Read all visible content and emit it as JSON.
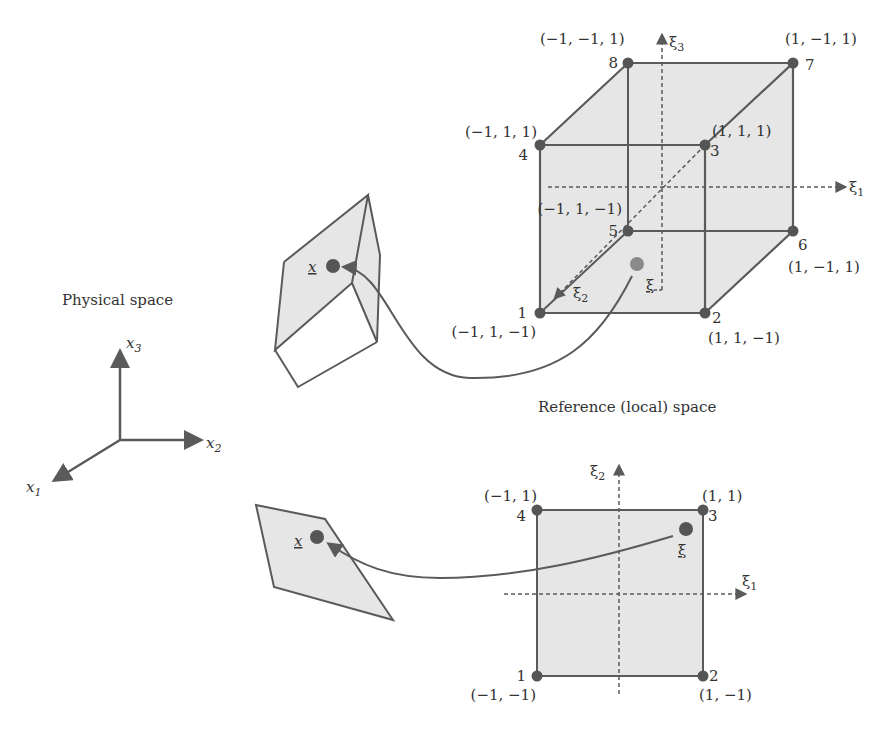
{
  "colors": {
    "edge": "#5a5a5a",
    "fill": "#e6e6e6",
    "node": "#555555",
    "point_ref_3d": "#8a8a8a",
    "text": "#333333",
    "background": "#ffffff"
  },
  "physical_space": {
    "title": "Physical space",
    "axes": {
      "x1": "x",
      "x1_sub": "1",
      "x2": "x",
      "x2_sub": "2",
      "x3": "x",
      "x3_sub": "3"
    },
    "hex_point_label": "x",
    "quad_point_label": "x"
  },
  "reference_space": {
    "title": "Reference (local) space",
    "hex": {
      "axes": {
        "xi1": "ξ",
        "xi1_sub": "1",
        "xi2": "ξ",
        "xi2_sub": "2",
        "xi3": "ξ",
        "xi3_sub": "3"
      },
      "point_label": "ξ",
      "nodes": [
        {
          "id": "1",
          "coords": "(−1, 1, −1)"
        },
        {
          "id": "2",
          "coords": "(1, 1, −1)"
        },
        {
          "id": "3",
          "coords": "(1, 1, 1)"
        },
        {
          "id": "4",
          "coords": "(−1, 1, 1)"
        },
        {
          "id": "5",
          "coords": "(−1, 1, −1)"
        },
        {
          "id": "6",
          "coords": "(1, −1, 1)"
        },
        {
          "id": "7",
          "coords": "(1, −1, 1)"
        },
        {
          "id": "8",
          "coords": "(−1, −1, 1)"
        }
      ]
    },
    "quad": {
      "axes": {
        "xi1": "ξ",
        "xi1_sub": "1",
        "xi2": "ξ",
        "xi2_sub": "2"
      },
      "point_label": "ξ",
      "nodes": [
        {
          "id": "1",
          "coords": "(−1, −1)"
        },
        {
          "id": "2",
          "coords": "(1, −1)"
        },
        {
          "id": "3",
          "coords": "(1, 1)"
        },
        {
          "id": "4",
          "coords": "(−1, 1)"
        }
      ]
    }
  }
}
